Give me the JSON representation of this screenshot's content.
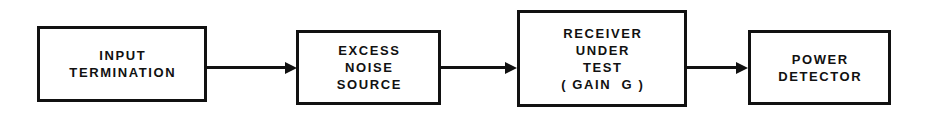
{
  "diagram": {
    "type": "block-diagram",
    "background_color": "#ffffff",
    "line_color": "#111111",
    "blocks": [
      {
        "id": "input-termination",
        "lines": [
          "INPUT",
          "TERMINATION"
        ],
        "x": 37,
        "y": 26,
        "width": 170,
        "height": 76
      },
      {
        "id": "excess-noise-source",
        "lines": [
          "EXCESS",
          "NOISE",
          "SOURCE"
        ],
        "x": 296,
        "y": 30,
        "width": 145,
        "height": 75
      },
      {
        "id": "receiver-under-test",
        "lines": [
          "RECEIVER",
          "UNDER",
          "TEST",
          "( GAIN  G )"
        ],
        "x": 517,
        "y": 10,
        "width": 170,
        "height": 97
      },
      {
        "id": "power-detector",
        "lines": [
          "POWER",
          "DETECTOR"
        ],
        "x": 748,
        "y": 30,
        "width": 143,
        "height": 75
      }
    ],
    "connectors": [
      {
        "id": "termination-to-noise-source",
        "x": 207,
        "y": 66,
        "length": 78
      },
      {
        "id": "noise-source-to-receiver",
        "x": 441,
        "y": 66,
        "length": 64
      },
      {
        "id": "receiver-to-detector",
        "x": 687,
        "y": 66,
        "length": 49
      }
    ]
  }
}
